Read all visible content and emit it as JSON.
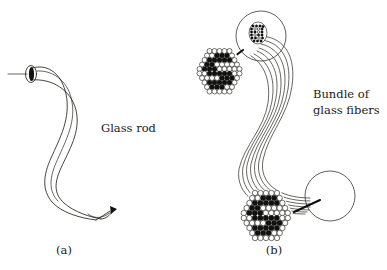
{
  "figure": {
    "title_visible": false,
    "background_color": "#ffffff",
    "ink_color": "#15140f",
    "width": 387,
    "height": 270,
    "panels": [
      {
        "id": "a",
        "caption": "(a)",
        "caption_x": 64,
        "caption_y": 254,
        "label": "Glass rod",
        "label_x": 101,
        "label_y": 132,
        "description": "A single curved glass rod with light entering the flat left end and exiting at the lower right tip."
      },
      {
        "id": "b",
        "caption": "(b)",
        "caption_x": 274,
        "caption_y": 254,
        "label_line1": "Bundle of",
        "label_line2": "glass fibers",
        "label_x": 313,
        "label_y1": 98,
        "label_y2": 114,
        "description": "A bundle of glass fibers curved in an S-shape, with magnifier circles at both ends revealing the hexagonal close-packed fiber cross-section that carries the letter S image."
      }
    ],
    "callouts": [
      {
        "name": "top-magnifier",
        "cx": 261,
        "cy": 36,
        "r": 25,
        "detail_shape": "hexagon",
        "detail_cx": 220,
        "detail_cy": 72,
        "detail_r": 26,
        "image_letter": "S"
      },
      {
        "name": "bottom-magnifier",
        "cx": 330,
        "cy": 196,
        "r": 25,
        "detail_shape": "hexagon",
        "detail_cx": 266,
        "detail_cy": 216,
        "detail_r": 28,
        "image_letter": "S"
      }
    ],
    "fiber_count_in_bundle": 7,
    "letter_in_cross_section": "S"
  }
}
